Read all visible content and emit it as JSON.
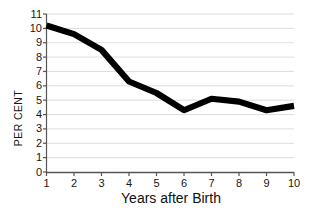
{
  "chart_data": {
    "type": "line",
    "title": "",
    "xlabel": "Years after Birth",
    "ylabel": "PER CENT",
    "x": [
      1,
      2,
      3,
      4,
      5,
      6,
      7,
      8,
      9,
      10
    ],
    "values": [
      10.2,
      9.6,
      8.5,
      6.3,
      5.5,
      4.3,
      5.1,
      4.9,
      4.3,
      4.6
    ],
    "series": [
      {
        "name": "Per cent",
        "values": [
          10.2,
          9.6,
          8.5,
          6.3,
          5.5,
          4.3,
          5.1,
          4.9,
          4.3,
          4.6
        ]
      }
    ],
    "xlim": [
      1,
      10
    ],
    "ylim": [
      0,
      11
    ],
    "xticks": [
      "1",
      "2",
      "3",
      "4",
      "5",
      "6",
      "7",
      "8",
      "9",
      "10"
    ],
    "yticks": [
      "0",
      "1",
      "2",
      "3",
      "4",
      "5",
      "6",
      "7",
      "8",
      "9",
      "10",
      "11"
    ],
    "grid": "horizontal",
    "legend": "none",
    "line_color": "#000000",
    "grid_color": "#d9d9d9",
    "axis_color": "#555555",
    "background_color": "#ffffff"
  }
}
